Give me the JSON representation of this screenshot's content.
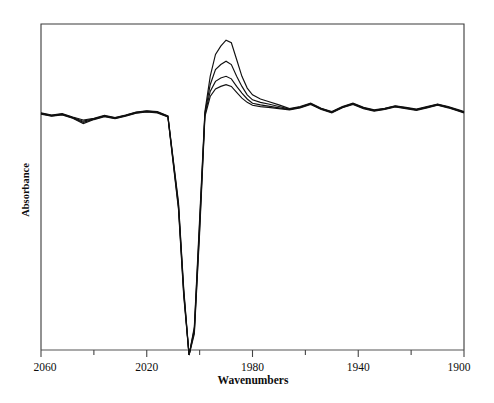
{
  "chart_data": {
    "type": "line",
    "title": "",
    "xlabel": "Wavenumbers",
    "ylabel": "Absorbance",
    "xlim": [
      2060,
      1900
    ],
    "x_axis_reversed": true,
    "ylim": [
      -1.0,
      1.0
    ],
    "grid": false,
    "legend": null,
    "y_ticks_shown": false,
    "x_major_ticks": [
      2060,
      2020,
      1980,
      1940,
      1900
    ],
    "x_minor_ticks": [
      2040,
      2000,
      1960,
      1920
    ],
    "x_tick_labels": [
      "2060",
      "2020",
      "1980",
      "1940",
      "1900"
    ],
    "annotations": [],
    "series_description": "Four overlaid time-resolved FTIR difference spectra of a metal-carbonyl band; shared negative bleach near 2000 cm-1 and positive transient band near 1984 cm-1 of differing intensity.",
    "x": [
      2060,
      2056,
      2052,
      2048,
      2044,
      2040,
      2036,
      2032,
      2028,
      2024,
      2020,
      2016,
      2012,
      2008,
      2006,
      2004,
      2002,
      2000,
      1998,
      1996,
      1994,
      1992,
      1990,
      1988,
      1986,
      1984,
      1982,
      1980,
      1977,
      1974,
      1970,
      1966,
      1962,
      1958,
      1954,
      1950,
      1946,
      1942,
      1938,
      1934,
      1930,
      1926,
      1922,
      1918,
      1914,
      1910,
      1906,
      1902,
      1900
    ],
    "series": [
      {
        "name": "spectrum-1",
        "values": [
          0.085,
          0.06,
          0.075,
          0.035,
          0.0,
          0.02,
          0.055,
          0.03,
          0.06,
          0.095,
          0.11,
          0.1,
          0.05,
          -0.35,
          -0.72,
          -1.0,
          -0.88,
          -0.42,
          0.1,
          0.52,
          0.78,
          0.88,
          0.95,
          0.92,
          0.72,
          0.52,
          0.38,
          0.3,
          0.25,
          0.22,
          0.18,
          0.135,
          0.16,
          0.2,
          0.14,
          0.1,
          0.16,
          0.2,
          0.15,
          0.12,
          0.14,
          0.17,
          0.15,
          0.13,
          0.16,
          0.19,
          0.16,
          0.12,
          0.1
        ]
      },
      {
        "name": "spectrum-2",
        "values": [
          0.08,
          0.055,
          0.07,
          0.03,
          -0.005,
          0.015,
          0.05,
          0.025,
          0.055,
          0.09,
          0.105,
          0.095,
          0.045,
          -0.36,
          -0.73,
          -1.0,
          -0.89,
          -0.44,
          0.08,
          0.42,
          0.6,
          0.66,
          0.7,
          0.66,
          0.52,
          0.4,
          0.3,
          0.24,
          0.21,
          0.19,
          0.16,
          0.13,
          0.155,
          0.195,
          0.135,
          0.095,
          0.155,
          0.195,
          0.145,
          0.115,
          0.135,
          0.165,
          0.145,
          0.125,
          0.155,
          0.185,
          0.155,
          0.115,
          0.095
        ]
      },
      {
        "name": "spectrum-3",
        "values": [
          0.075,
          0.05,
          0.065,
          0.025,
          -0.01,
          0.01,
          0.045,
          0.02,
          0.05,
          0.085,
          0.1,
          0.09,
          0.04,
          -0.37,
          -0.74,
          -1.0,
          -0.9,
          -0.46,
          0.06,
          0.34,
          0.46,
          0.5,
          0.52,
          0.49,
          0.4,
          0.32,
          0.25,
          0.2,
          0.18,
          0.165,
          0.145,
          0.125,
          0.15,
          0.19,
          0.13,
          0.09,
          0.15,
          0.19,
          0.14,
          0.11,
          0.13,
          0.16,
          0.14,
          0.12,
          0.15,
          0.18,
          0.15,
          0.11,
          0.09
        ]
      },
      {
        "name": "spectrum-4",
        "values": [
          0.07,
          0.045,
          0.06,
          0.02,
          -0.015,
          0.005,
          0.04,
          0.015,
          0.045,
          0.08,
          0.095,
          0.085,
          0.035,
          -0.38,
          -0.75,
          -1.0,
          -0.91,
          -0.48,
          0.04,
          0.28,
          0.37,
          0.4,
          0.42,
          0.4,
          0.33,
          0.26,
          0.21,
          0.175,
          0.16,
          0.15,
          0.135,
          0.12,
          0.145,
          0.185,
          0.125,
          0.085,
          0.145,
          0.185,
          0.135,
          0.105,
          0.125,
          0.155,
          0.135,
          0.115,
          0.145,
          0.175,
          0.145,
          0.105,
          0.085
        ]
      }
    ]
  },
  "figure": {
    "background_color": "#ffffff",
    "line_color": "#111111",
    "frame_color": "#3a3a3a"
  }
}
